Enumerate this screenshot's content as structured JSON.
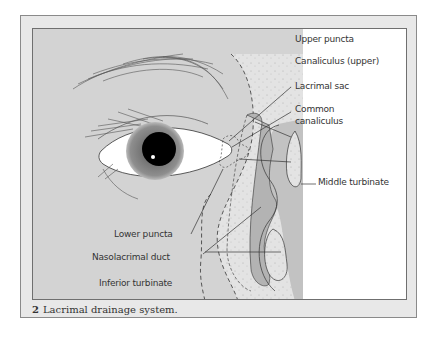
{
  "figure": {
    "number": "2",
    "caption": "Lacrimal drainage system.",
    "labels": {
      "upper_puncta": "Upper puncta",
      "canaliculus_upper": "Canaliculus (upper)",
      "lacrimal_sac": "Lacrimal sac",
      "common_canaliculus_1": "Common",
      "common_canaliculus_2": "canaliculus",
      "middle_turbinate": "Middle turbinate",
      "lower_puncta": "Lower puncta",
      "nasolacrimal_duct": "Nasolacrimal duct",
      "inferior_turbinate": "Inferior turbinate"
    },
    "colors": {
      "frame_bg": "#e8e8e8",
      "drawing_bg": "#d3d3d3",
      "nasal_bg": "#c4c4c4",
      "white_bg": "#ffffff",
      "duct": "#b5b5b5",
      "dotted_region": "#e2e2e2"
    }
  }
}
